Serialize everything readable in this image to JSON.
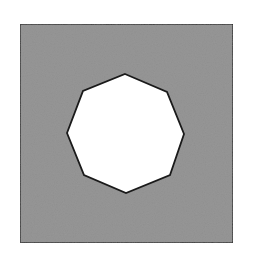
{
  "figure": {
    "width": 255,
    "height": 263,
    "background": "#ffffff"
  },
  "square": {
    "x": 20,
    "y": 24,
    "width": 213,
    "height": 219,
    "fill": "#8f8f8f",
    "stroke": "#222222",
    "stroke_width": 1.5
  },
  "octagon": {
    "points": [
      [
        125,
        74
      ],
      [
        167,
        92
      ],
      [
        184,
        134
      ],
      [
        170,
        175
      ],
      [
        126,
        193
      ],
      [
        84,
        175
      ],
      [
        67,
        133
      ],
      [
        83,
        91
      ]
    ],
    "fill": "#ffffff",
    "stroke": "#1a1a1a",
    "stroke_width": 1.8
  }
}
